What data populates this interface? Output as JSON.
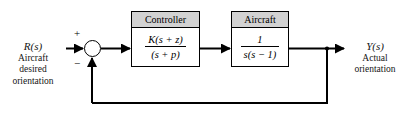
{
  "diagram": {
    "type": "control-system-block-diagram",
    "background_color": "#ffffff",
    "line_color": "#000000",
    "header_fill_color": "#d2d2d2",
    "input": {
      "symbol": "R(s)",
      "description_lines": [
        "Aircraft",
        "desired",
        "orientation"
      ]
    },
    "output": {
      "symbol": "Y(s)",
      "description_lines": [
        "Actual",
        "orientation"
      ]
    },
    "summing_junction": {
      "name": "summing-junction",
      "positive_sign": "+",
      "negative_sign": "−"
    },
    "blocks": [
      {
        "id": "controller",
        "title": "Controller",
        "numerator": "K(s + z)",
        "denominator": "(s + p)"
      },
      {
        "id": "aircraft",
        "title": "Aircraft",
        "numerator": "1",
        "denominator": "s(s − 1)"
      }
    ],
    "feedback": {
      "path": "unity-feedback",
      "gain": "1"
    }
  }
}
